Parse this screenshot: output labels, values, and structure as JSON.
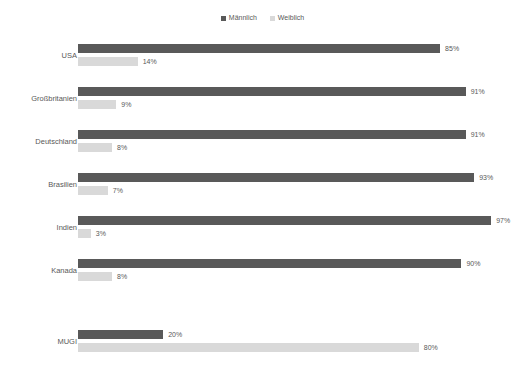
{
  "legend": {
    "position": "top-center",
    "entries": [
      {
        "label": "Männlich",
        "color": "#595959",
        "icon": "square-swatch"
      },
      {
        "label": "Weiblich",
        "color": "#d9d9d9",
        "icon": "square-swatch"
      }
    ]
  },
  "colors": {
    "male": "#595959",
    "female": "#d9d9d9",
    "text": "#595959",
    "background": "#ffffff"
  },
  "chart_data": {
    "type": "bar",
    "orientation": "horizontal",
    "title": "",
    "subtitle": "",
    "xlabel": "",
    "ylabel": "",
    "xlim": [
      0,
      100
    ],
    "grid": false,
    "value_suffix": "%",
    "legend_position": "top-center",
    "categories": [
      "USA",
      "Großbritanien",
      "Deutschland",
      "Brasilien",
      "Indien",
      "Kanada",
      "MUGI"
    ],
    "series": [
      {
        "name": "Männlich",
        "color": "#595959",
        "values": [
          85,
          91,
          91,
          93,
          97,
          90,
          20
        ],
        "labels": [
          "85%",
          "91%",
          "91%",
          "93%",
          "97%",
          "90%",
          "20%"
        ]
      },
      {
        "name": "Weiblich",
        "color": "#d9d9d9",
        "values": [
          14,
          9,
          8,
          7,
          3,
          8,
          80
        ],
        "labels": [
          "14%",
          "9%",
          "8%",
          "7%",
          "3%",
          "8%",
          "80%"
        ]
      }
    ]
  },
  "footer": {
    "clipped_text": ""
  }
}
